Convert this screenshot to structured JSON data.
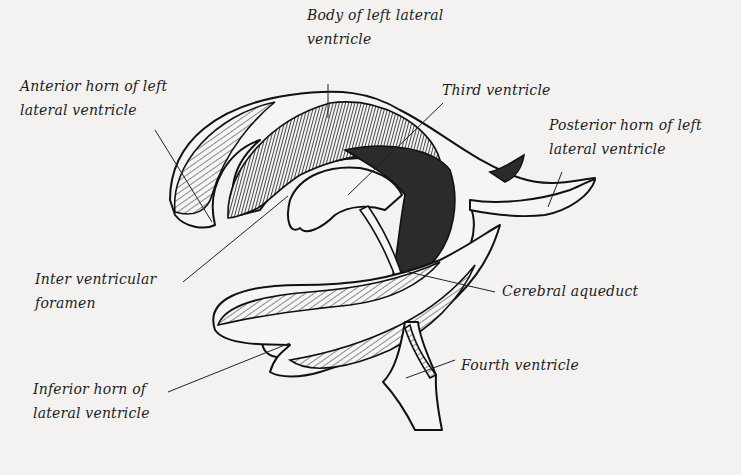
{
  "figure": {
    "ink_color": "#111111",
    "paper_color": "#f3f2f0"
  },
  "labels": {
    "anterior_horn": [
      "Anterior horn of left",
      "lateral ventricle"
    ],
    "body": [
      "Body of left lateral",
      "ventricle"
    ],
    "third": [
      "Third ventricle"
    ],
    "posterior_horn": [
      "Posterior horn of left",
      "lateral ventricle"
    ],
    "interventricular": [
      "Inter ventricular",
      "foramen"
    ],
    "aqueduct": [
      "Cerebral aqueduct"
    ],
    "inferior_horn": [
      "Inferior horn of",
      "lateral ventricle"
    ],
    "fourth": [
      "Fourth ventricle"
    ]
  }
}
